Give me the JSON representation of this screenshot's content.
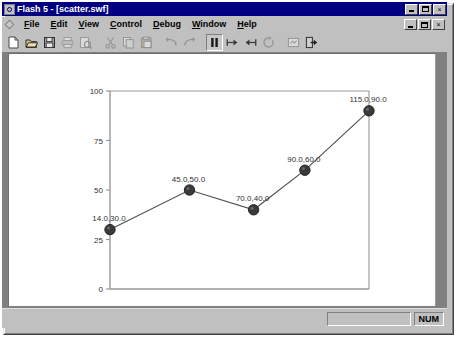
{
  "window": {
    "title": "Flash 5 - [scatter.swf]",
    "app_icon": "flash-icon",
    "buttons": {
      "minimize": "minimize-icon",
      "maximize": "maximize-icon",
      "close": "×"
    },
    "child_buttons": {
      "minimize": "minimize-icon",
      "restore": "restore-icon",
      "close": "×"
    }
  },
  "menu": {
    "mdi_icon": "document-control-icon",
    "items": [
      {
        "label": "File",
        "accel": "F"
      },
      {
        "label": "Edit",
        "accel": "E"
      },
      {
        "label": "View",
        "accel": "V"
      },
      {
        "label": "Control",
        "accel": "C"
      },
      {
        "label": "Debug",
        "accel": "D"
      },
      {
        "label": "Window",
        "accel": "W"
      },
      {
        "label": "Help",
        "accel": "H"
      }
    ]
  },
  "toolbar": {
    "items": [
      {
        "name": "new-icon",
        "label": "New",
        "enabled": true,
        "pressed": false
      },
      {
        "name": "open-icon",
        "label": "Open",
        "enabled": true,
        "pressed": false
      },
      {
        "name": "save-icon",
        "label": "Save",
        "enabled": true,
        "pressed": false
      },
      {
        "name": "print-icon",
        "label": "Print",
        "enabled": false,
        "pressed": false
      },
      {
        "name": "print-preview-icon",
        "label": "Print Preview",
        "enabled": false,
        "pressed": false
      },
      {
        "name": "cut-icon",
        "label": "Cut",
        "enabled": false,
        "pressed": false
      },
      {
        "name": "copy-icon",
        "label": "Copy",
        "enabled": false,
        "pressed": false
      },
      {
        "name": "paste-icon",
        "label": "Paste",
        "enabled": false,
        "pressed": false
      },
      {
        "name": "undo-icon",
        "label": "Undo",
        "enabled": false,
        "pressed": false
      },
      {
        "name": "redo-icon",
        "label": "Redo",
        "enabled": false,
        "pressed": false
      },
      {
        "name": "pause-icon",
        "label": "Pause",
        "enabled": true,
        "pressed": true
      },
      {
        "name": "step-forward-icon",
        "label": "Step Forward",
        "enabled": true,
        "pressed": false
      },
      {
        "name": "step-back-icon",
        "label": "Step Back",
        "enabled": true,
        "pressed": false
      },
      {
        "name": "loop-icon",
        "label": "Loop",
        "enabled": false,
        "pressed": false
      },
      {
        "name": "show-all-icon",
        "label": "Show All",
        "enabled": false,
        "pressed": false
      },
      {
        "name": "export-icon",
        "label": "Export",
        "enabled": true,
        "pressed": false
      }
    ]
  },
  "statusbar": {
    "message": "",
    "indicators": [
      "",
      "NUM"
    ]
  },
  "chart_data": {
    "type": "line",
    "title": "",
    "xlabel": "",
    "ylabel": "",
    "x": [
      14.0,
      45.0,
      70.0,
      90.0,
      115.0
    ],
    "values": [
      30.0,
      50.0,
      40.0,
      60.0,
      90.0
    ],
    "point_labels": [
      "14.0,30.0",
      "45.0,50.0",
      "70.0,40.0",
      "90.0,60.0",
      "115.0,90.0"
    ],
    "yticks": [
      0,
      25,
      50,
      75,
      100
    ],
    "ytick_labels": [
      "0",
      "25",
      "50",
      "75",
      "100"
    ],
    "ylim": [
      0,
      100
    ],
    "xlim": [
      14.0,
      115.0
    ],
    "grid": false,
    "legend": false,
    "axis_color": "#999999",
    "line_color": "#4d4d4d",
    "marker_color": "#3a3a3a",
    "label_color": "#333333",
    "background": "#ffffff"
  }
}
